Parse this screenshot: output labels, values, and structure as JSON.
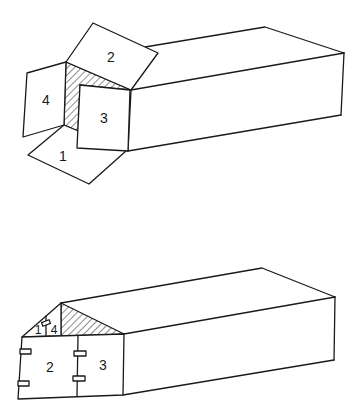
{
  "diagram": {
    "title": "",
    "figures": [
      {
        "name": "open-box",
        "state": "flaps open",
        "flap_labels": [
          "1",
          "2",
          "3",
          "4"
        ],
        "shaded_region": "interior corner (hatched)"
      },
      {
        "name": "closed-box",
        "state": "flaps folded with tabs",
        "flap_labels": [
          "1",
          "4",
          "2",
          "3"
        ],
        "shaded_region": "triangular end (hatched)"
      }
    ],
    "labels": {
      "top_flap_1": "1",
      "top_flap_2": "2",
      "top_flap_3": "3",
      "top_flap_4": "4",
      "bottom_flap_1": "1",
      "bottom_flap_4": "4",
      "bottom_flap_2": "2",
      "bottom_flap_3": "3"
    },
    "colors": {
      "stroke": "#1a1a1a",
      "background": "#ffffff"
    }
  }
}
